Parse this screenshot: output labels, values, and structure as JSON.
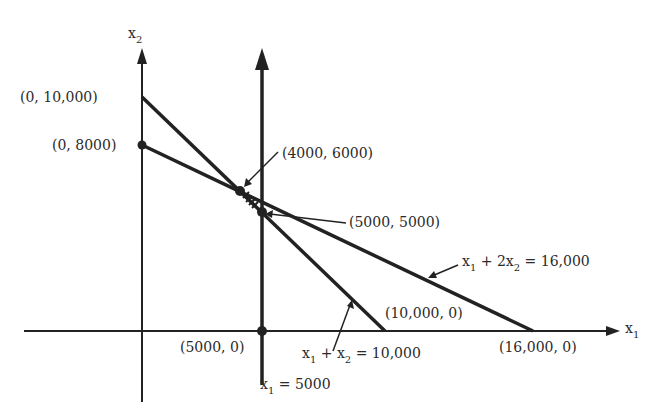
{
  "diagram": {
    "type": "linear-programming-feasible-region",
    "axes": {
      "x_label": "x",
      "x_label_sub": "1",
      "y_label": "x",
      "y_label_sub": "2"
    },
    "points": [
      {
        "id": "p0_10000",
        "label": "(0, 10,000)"
      },
      {
        "id": "p0_8000",
        "label": "(0, 8000)"
      },
      {
        "id": "p4000_6000",
        "label": "(4000, 6000)"
      },
      {
        "id": "p5000_5000",
        "label": "(5000, 5000)"
      },
      {
        "id": "p10000_0",
        "label": "(10,000, 0)"
      },
      {
        "id": "p16000_0",
        "label": "(16,000, 0)"
      },
      {
        "id": "p5000_0",
        "label": "(5000, 0)"
      }
    ],
    "constraints": [
      {
        "id": "c1",
        "lhs_a": "x",
        "lhs_a_sub": "1",
        "op": " + 2x",
        "lhs_b_sub": "2",
        "rhs": " = 16,000"
      },
      {
        "id": "c2",
        "lhs_a": "x",
        "lhs_a_sub": "1",
        "op": " + x",
        "lhs_b_sub": "2",
        "rhs": " = 10,000"
      },
      {
        "id": "c3",
        "lhs_a": "x",
        "lhs_a_sub": "1",
        "rhs": " = 5000"
      }
    ],
    "colors": {
      "line": "#222222",
      "text": "#2a2a2a",
      "background": "#ffffff"
    }
  }
}
